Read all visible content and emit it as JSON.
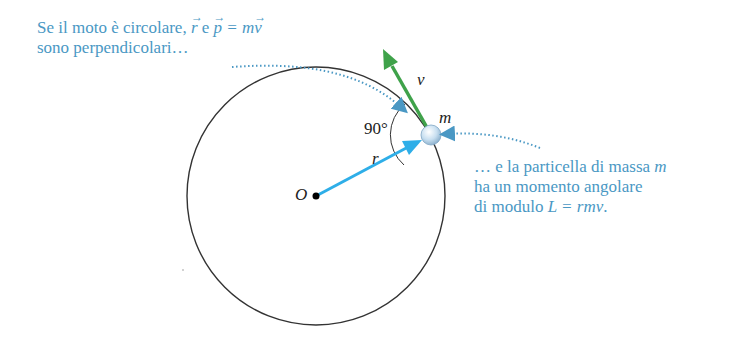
{
  "annotations": {
    "top_left": {
      "line1_prefix": "Se il moto è circolare, ",
      "vec_r": "r",
      "conj": " e ",
      "vec_p": "p",
      "eq": " = m",
      "vec_v": "v",
      "line2": "sono perpendicolari…"
    },
    "right": {
      "line1_prefix": "… e la particella di massa ",
      "line1_var": "m",
      "line2": "ha un momento angolare",
      "line3_prefix": "di modulo ",
      "line3_formula": "L = rmv",
      "line3_suffix": "."
    }
  },
  "labels": {
    "origin": "O",
    "radius": "r",
    "velocity": "v",
    "mass": "m",
    "angle": "90°"
  },
  "colors": {
    "annotation_text": "#4a98c4",
    "radius_vector": "#2eaee8",
    "velocity_vector": "#3fa24a",
    "circle": "#333333",
    "particle": "#c8dff0"
  },
  "geometry": {
    "center": [
      316,
      196
    ],
    "radius": 129,
    "particle": [
      431,
      135
    ],
    "velocity_tip": [
      384,
      50
    ]
  }
}
